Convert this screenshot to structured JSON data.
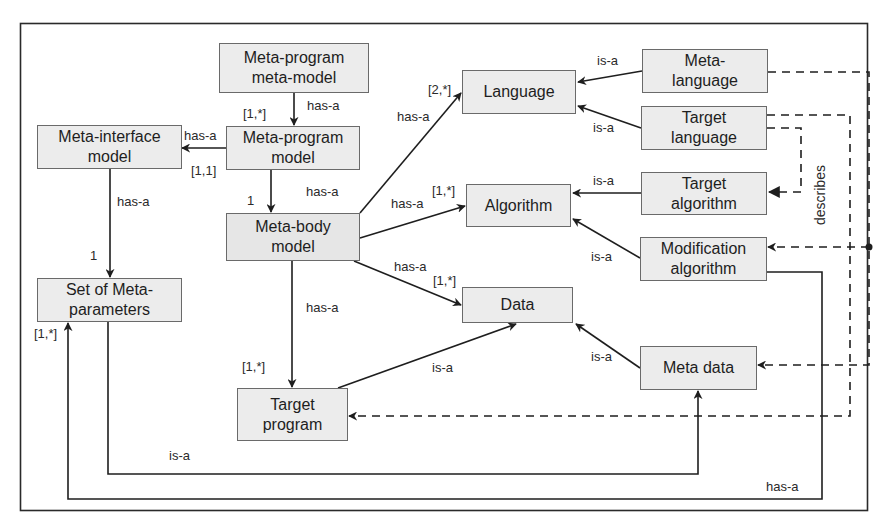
{
  "diagram": {
    "type": "UML-style meta-program model diagram",
    "colors": {
      "box_fill": "#ececec",
      "box_border": "#6a6a6a",
      "line": "#2a2a2a",
      "background": "#ffffff"
    },
    "nodes": {
      "meta_program_meta_model": {
        "line1": "Meta-program",
        "line2": "meta-model"
      },
      "meta_program_model": {
        "line1": "Meta-program",
        "line2": "model"
      },
      "meta_interface_model": {
        "line1": "Meta-interface",
        "line2": "model"
      },
      "meta_body_model": {
        "line1": "Meta-body",
        "line2": "model"
      },
      "set_of_meta_parameters": {
        "line1": "Set of Meta-",
        "line2": "parameters"
      },
      "target_program": {
        "line1": "Target",
        "line2": "program"
      },
      "language": {
        "line1": "Language"
      },
      "algorithm": {
        "line1": "Algorithm"
      },
      "data": {
        "line1": "Data"
      },
      "meta_language": {
        "line1": "Meta-",
        "line2": "language"
      },
      "target_language": {
        "line1": "Target",
        "line2": "language"
      },
      "target_algorithm": {
        "line1": "Target",
        "line2": "algorithm"
      },
      "modification_algorithm": {
        "line1": "Modification",
        "line2": "algorithm"
      },
      "meta_data": {
        "line1": "Meta data"
      }
    },
    "edge_labels": {
      "mpmm_to_mpm": "has-a",
      "mpmm_to_mpm_mult": "[1,*]",
      "mpm_to_mim": "has-a",
      "mpm_to_mim_mult": "[1,1]",
      "mpm_to_mbm": "has-a",
      "mpm_to_mbm_mult": "1",
      "mim_to_smp": "has-a",
      "mim_to_smp_mult": "1",
      "mbm_to_language": "has-a",
      "mbm_to_language_mult": "[2,*]",
      "mbm_to_algorithm": "has-a",
      "mbm_to_algorithm_mult": "[1,*]",
      "mbm_to_data": "has-a",
      "mbm_to_data_mult": "[1,*]",
      "mbm_to_target_program": "has-a",
      "mbm_to_target_program_mult": "[1,*]",
      "meta_language_is_a": "is-a",
      "target_language_is_a": "is-a",
      "target_algorithm_is_a": "is-a",
      "modification_algorithm_is_a": "is-a",
      "meta_data_is_a": "is-a",
      "target_program_is_a": "is-a",
      "smp_to_meta_data": "is-a",
      "modification_to_smp": "has-a",
      "modification_to_smp_mult": "[1,*]",
      "describes": "describes"
    }
  }
}
